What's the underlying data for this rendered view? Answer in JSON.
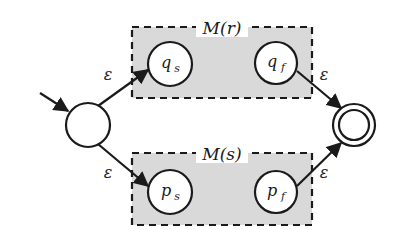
{
  "diagram": {
    "type": "nfa-union-construction",
    "colors": {
      "stroke": "#1a1a1a",
      "box_fill": "#d9d9d9",
      "background": "#ffffff"
    },
    "start_state": {
      "label": "",
      "is_start": true
    },
    "accept_state": {
      "label": "",
      "is_accept": true
    },
    "sub_machines": [
      {
        "label": "M(r)",
        "states": [
          {
            "id": "q_s",
            "base": "q",
            "sub": "s"
          },
          {
            "id": "q_f",
            "base": "q",
            "sub": "f"
          }
        ]
      },
      {
        "label": "M(s)",
        "states": [
          {
            "id": "p_s",
            "base": "p",
            "sub": "s"
          },
          {
            "id": "p_f",
            "base": "p",
            "sub": "f"
          }
        ]
      }
    ],
    "edges": [
      {
        "from": "start",
        "to": "q_s",
        "label": "ε"
      },
      {
        "from": "start",
        "to": "p_s",
        "label": "ε"
      },
      {
        "from": "q_f",
        "to": "accept",
        "label": "ε"
      },
      {
        "from": "p_f",
        "to": "accept",
        "label": "ε"
      }
    ]
  }
}
